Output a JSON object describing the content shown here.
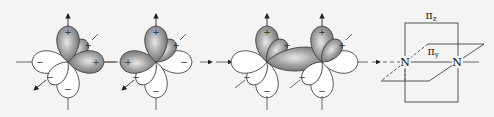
{
  "diagram": {
    "colors": {
      "background": "#f4f4f4",
      "positive_lobe": "#8a8a8a",
      "negative_lobe": "#ffffff",
      "outline": "#444444"
    },
    "panels": [
      {
        "id": "atom-1",
        "positive_sign": "+",
        "negative_sign": "−"
      },
      {
        "id": "atom-2",
        "positive_sign": "+",
        "negative_sign": "−"
      },
      {
        "id": "overlap",
        "positive_sign": "+",
        "negative_sign": "−"
      },
      {
        "id": "bond-planes"
      }
    ],
    "bond_planes": {
      "atom_left": "N",
      "atom_right": "N",
      "pi_z_label": "π",
      "pi_z_sub": "z",
      "pi_y_label": "π",
      "pi_y_sub": "y"
    },
    "signs": {
      "plus": "+",
      "minus": "−"
    }
  }
}
